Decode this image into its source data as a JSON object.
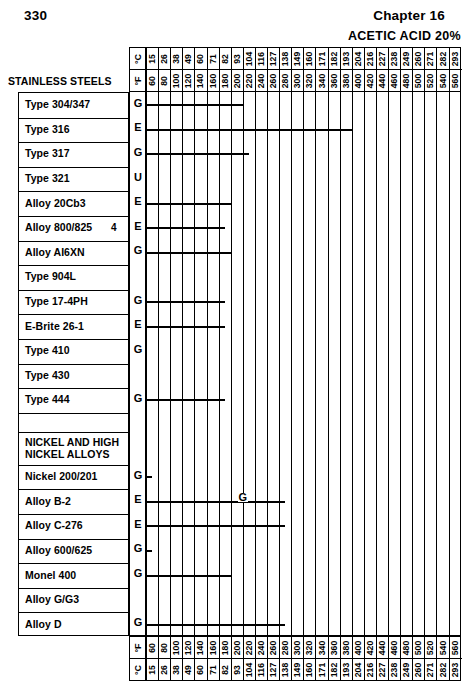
{
  "page": {
    "folio": "330",
    "chapter": "Chapter 16",
    "media_title": "ACETIC ACID 20%"
  },
  "axis": {
    "unit_c_label": "°C",
    "unit_f_label": "°F",
    "group_header": "STAINLESS STEELS",
    "f_ticks": [
      60,
      80,
      100,
      120,
      140,
      160,
      180,
      200,
      220,
      240,
      260,
      280,
      300,
      320,
      340,
      360,
      380,
      400,
      420,
      440,
      460,
      480,
      500,
      520,
      540,
      560
    ],
    "c_ticks": [
      15,
      26,
      38,
      49,
      60,
      71,
      82,
      93,
      104,
      116,
      127,
      138,
      149,
      160,
      171,
      182,
      193,
      204,
      216,
      227,
      238,
      249,
      260,
      271,
      282,
      293
    ]
  },
  "chart_data": {
    "type": "bar",
    "title": "ACETIC ACID 20%",
    "xlabel": "Temperature",
    "ylabel": "Alloy",
    "xlim": [
      60,
      570
    ],
    "grid": true,
    "orientation": "horizontal",
    "x_unit_primary": "°F",
    "x_unit_secondary": "°C",
    "legend": [
      {
        "code": "E",
        "meaning": "Excellent"
      },
      {
        "code": "G",
        "meaning": "Good"
      },
      {
        "code": "U",
        "meaning": "Unsatisfactory"
      }
    ],
    "categories": [
      "Type 304/347",
      "Type 316",
      "Type 317",
      "Type 321",
      "Alloy 20Cb3",
      "Alloy 800/825",
      "Alloy AI6XN",
      "Type 904L",
      "Type 17-4PH",
      "E-Brite 26-1",
      "Type 410",
      "Type 430",
      "Type 444",
      "",
      "NICKEL AND HIGH NICKEL ALLOYS",
      "Nickel 200/201",
      "Alloy B-2",
      "Alloy C-276",
      "Alloy 600/625",
      "Monel 400",
      "Alloy G/G3",
      "Alloy D"
    ],
    "values": [
      220,
      400,
      230,
      null,
      200,
      190,
      200,
      null,
      190,
      190,
      null,
      null,
      190,
      null,
      null,
      70,
      290,
      290,
      70,
      200,
      null,
      290
    ],
    "rows": [
      {
        "label": "Type 304/347",
        "grade": "G",
        "start_f": 60,
        "end_f": 220,
        "mid": null,
        "footnote": null,
        "type": "data"
      },
      {
        "label": "Type 316",
        "grade": "E",
        "start_f": 60,
        "end_f": 400,
        "mid": null,
        "footnote": null,
        "type": "data"
      },
      {
        "label": "Type 317",
        "grade": "G",
        "start_f": 60,
        "end_f": 230,
        "mid": null,
        "footnote": null,
        "type": "data"
      },
      {
        "label": "Type 321",
        "grade": "U",
        "start_f": null,
        "end_f": null,
        "mid": null,
        "footnote": null,
        "type": "data"
      },
      {
        "label": "Alloy 20Cb3",
        "grade": "E",
        "start_f": 60,
        "end_f": 200,
        "mid": null,
        "footnote": null,
        "type": "data"
      },
      {
        "label": "Alloy 800/825",
        "grade": "E",
        "start_f": 60,
        "end_f": 190,
        "mid": null,
        "footnote": "4",
        "type": "data"
      },
      {
        "label": "Alloy AI6XN",
        "grade": "G",
        "start_f": 60,
        "end_f": 200,
        "mid": null,
        "footnote": null,
        "type": "data"
      },
      {
        "label": "Type 904L",
        "grade": "",
        "start_f": null,
        "end_f": null,
        "mid": null,
        "footnote": null,
        "type": "data"
      },
      {
        "label": "Type 17-4PH",
        "grade": "G",
        "start_f": 60,
        "end_f": 190,
        "mid": null,
        "footnote": null,
        "type": "data"
      },
      {
        "label": "E-Brite 26-1",
        "grade": "E",
        "start_f": 60,
        "end_f": 190,
        "mid": null,
        "footnote": null,
        "type": "data"
      },
      {
        "label": "Type 410",
        "grade": "G",
        "start_f": null,
        "end_f": null,
        "mid": null,
        "footnote": null,
        "type": "data"
      },
      {
        "label": "Type 430",
        "grade": "",
        "start_f": null,
        "end_f": null,
        "mid": null,
        "footnote": null,
        "type": "data"
      },
      {
        "label": "Type 444",
        "grade": "G",
        "start_f": 60,
        "end_f": 190,
        "mid": null,
        "footnote": null,
        "type": "data"
      },
      {
        "label": "",
        "grade": "",
        "start_f": null,
        "end_f": null,
        "mid": null,
        "footnote": null,
        "type": "spacer"
      },
      {
        "label": "NICKEL AND HIGH\nNICKEL ALLOYS",
        "grade": "",
        "start_f": null,
        "end_f": null,
        "mid": null,
        "footnote": null,
        "type": "section"
      },
      {
        "label": "Nickel 200/201",
        "grade": "G",
        "start_f": 60,
        "end_f": 70,
        "mid": null,
        "footnote": null,
        "type": "data"
      },
      {
        "label": "Alloy B-2",
        "grade": "E",
        "start_f": 60,
        "end_f": 290,
        "mid": {
          "code": "G",
          "at_f": 218
        },
        "footnote": null,
        "type": "data"
      },
      {
        "label": "Alloy C-276",
        "grade": "E",
        "start_f": 60,
        "end_f": 290,
        "mid": null,
        "footnote": null,
        "type": "data"
      },
      {
        "label": "Alloy 600/625",
        "grade": "G",
        "start_f": 60,
        "end_f": 70,
        "mid": null,
        "footnote": null,
        "type": "data"
      },
      {
        "label": "Monel 400",
        "grade": "G",
        "start_f": 60,
        "end_f": 200,
        "mid": null,
        "footnote": null,
        "type": "data"
      },
      {
        "label": "Alloy G/G3",
        "grade": "",
        "start_f": null,
        "end_f": null,
        "mid": null,
        "footnote": null,
        "type": "data"
      },
      {
        "label": "Alloy D",
        "grade": "G",
        "start_f": 60,
        "end_f": 290,
        "mid": null,
        "footnote": null,
        "type": "data"
      }
    ]
  }
}
